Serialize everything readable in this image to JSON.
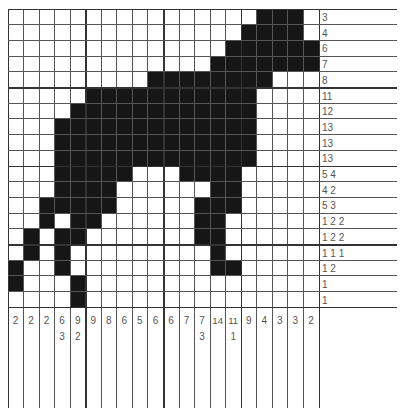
{
  "puzzle": {
    "type": "nonogram",
    "cols": 20,
    "rows": 19,
    "fill_color": "#161616",
    "grid_line_color": "#555555",
    "row_clues": [
      "3",
      "4",
      "6",
      "7",
      "8",
      "11",
      "12",
      "13",
      "13",
      "13",
      "5 4",
      "4 2",
      "5 3",
      "1 2 2",
      "1 2 2",
      "1 1 1",
      "1 2",
      "1",
      "1"
    ],
    "col_clues": [
      [
        "2"
      ],
      [
        "2"
      ],
      [
        "2"
      ],
      [
        "6",
        "3"
      ],
      [
        "9",
        "2"
      ],
      [
        "9"
      ],
      [
        "8"
      ],
      [
        "6"
      ],
      [
        "5"
      ],
      [
        "6"
      ],
      [
        "6"
      ],
      [
        "7"
      ],
      [
        "7",
        "3"
      ],
      [
        "14"
      ],
      [
        "11",
        "1"
      ],
      [
        "9"
      ],
      [
        "4"
      ],
      [
        "3"
      ],
      [
        "3"
      ],
      [
        "2"
      ]
    ],
    "filled_rows": [
      [
        16,
        17,
        18
      ],
      [
        15,
        16,
        17,
        18
      ],
      [
        14,
        15,
        16,
        17,
        18,
        19
      ],
      [
        13,
        14,
        15,
        16,
        17,
        18,
        19
      ],
      [
        9,
        10,
        11,
        12,
        13,
        14,
        15,
        16
      ],
      [
        5,
        6,
        7,
        8,
        9,
        10,
        11,
        12,
        13,
        14,
        15
      ],
      [
        4,
        5,
        6,
        7,
        8,
        9,
        10,
        11,
        12,
        13,
        14,
        15
      ],
      [
        3,
        4,
        5,
        6,
        7,
        8,
        9,
        10,
        11,
        12,
        13,
        14,
        15
      ],
      [
        3,
        4,
        5,
        6,
        7,
        8,
        9,
        10,
        11,
        12,
        13,
        14,
        15
      ],
      [
        3,
        4,
        5,
        6,
        7,
        8,
        9,
        10,
        11,
        12,
        13,
        14,
        15
      ],
      [
        3,
        4,
        5,
        6,
        7,
        11,
        12,
        13,
        14
      ],
      [
        3,
        4,
        5,
        6,
        13,
        14
      ],
      [
        2,
        3,
        4,
        5,
        6,
        12,
        13,
        14
      ],
      [
        2,
        4,
        5,
        12,
        13
      ],
      [
        1,
        3,
        4,
        12,
        13
      ],
      [
        1,
        3,
        13
      ],
      [
        0,
        3,
        13,
        14
      ],
      [
        0,
        4
      ],
      [
        4
      ]
    ]
  }
}
